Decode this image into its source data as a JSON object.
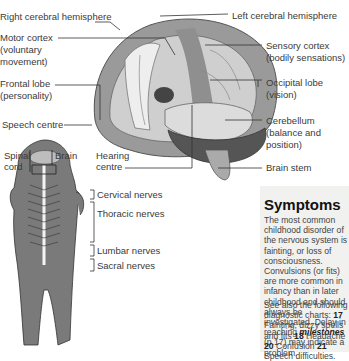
{
  "brain_labels": {
    "right_hemisphere": "Right cerebral hemisphere",
    "left_hemisphere": "Left cerebral hemisphere",
    "motor_cortex": [
      "Motor cortex",
      "(voluntary",
      "movement)"
    ],
    "sensory_cortex": [
      "Sensory cortex",
      "(bodily sensations)"
    ],
    "frontal_lobe": [
      "Frontal lobe",
      "(personality)"
    ],
    "occipital_lobe": [
      "Occipital lobe",
      "(vision)"
    ],
    "speech_centre": "Speech centre",
    "cerebellum": [
      "Cerebellum",
      "(balance and",
      "position)"
    ],
    "hearing_centre": [
      "Hearing",
      "centre"
    ],
    "brain_stem": "Brain stem"
  },
  "body_labels": {
    "spinal_cord": [
      "Spinal",
      "cord"
    ],
    "brain": "Brain",
    "cervical": "Cervical nerves",
    "thoracic": "Thoracic nerves",
    "lumbar": "Lumbar nerves",
    "sacral": "Sacral nerves"
  },
  "symptoms": {
    "title": "Symptoms",
    "paragraph_part1": "The most common childhood disorder of the nervous system is fainting, or loss of consciousness. Convulsions (or fits) are more common in infancy than in later childhood and should always be investigated. Delay in reaching ",
    "paragraph_emphasis": "milestones",
    "paragraph_part2": " (p.17) may indicate a problem.",
    "see_also_intro": "See also the following diagnostic charts: ",
    "charts": [
      {
        "num": "17",
        "label": "Fainting, dizzy spells and fits"
      },
      {
        "num": "18",
        "label": "Headache"
      },
      {
        "num": "20",
        "label": "Confusion"
      },
      {
        "num": "21",
        "label": "Speech difficulties."
      }
    ]
  },
  "colors": {
    "panel_bg": "#f1f1ef",
    "illustration_dark": "#555555",
    "illustration_mid": "#8a8a8a",
    "illustration_light": "#c8c8c8"
  }
}
